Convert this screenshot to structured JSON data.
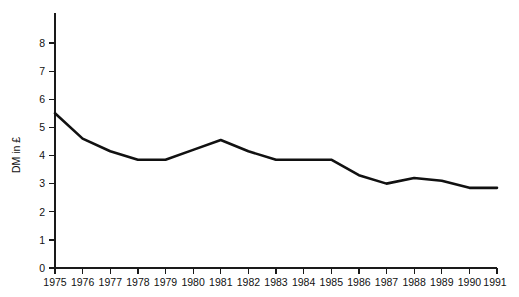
{
  "chart_data": {
    "type": "line",
    "title": "",
    "subtitle": "",
    "xlabel": "",
    "ylabel": "DM in £",
    "categories": [
      "1975",
      "1976",
      "1977",
      "1978",
      "1979",
      "1980",
      "1981",
      "1982",
      "1983",
      "1984",
      "1985",
      "1986",
      "1987",
      "1988",
      "1989",
      "1990",
      "1991"
    ],
    "x": [
      1975,
      1976,
      1977,
      1978,
      1979,
      1980,
      1981,
      1982,
      1983,
      1984,
      1985,
      1986,
      1987,
      1988,
      1989,
      1990,
      1991
    ],
    "values": [
      5.5,
      4.6,
      4.15,
      3.85,
      3.85,
      4.2,
      4.55,
      4.15,
      3.85,
      3.85,
      3.85,
      3.3,
      3.0,
      3.2,
      3.1,
      2.85,
      2.85
    ],
    "series": [
      {
        "name": "DM in £",
        "values": [
          5.5,
          4.6,
          4.15,
          3.85,
          3.85,
          4.2,
          4.55,
          4.15,
          3.85,
          3.85,
          3.85,
          3.3,
          3.0,
          3.2,
          3.1,
          2.85,
          2.85
        ],
        "color": "#111111"
      }
    ],
    "ylim": [
      0,
      8.6
    ],
    "xlim": [
      1975,
      1991
    ],
    "yticks": [
      0,
      1,
      2,
      3,
      4,
      5,
      6,
      7,
      8
    ],
    "ytick_labels": [
      "0",
      "1",
      "2",
      "3",
      "4",
      "5",
      "6",
      "7",
      "8"
    ],
    "xticks": [
      1975,
      1976,
      1977,
      1978,
      1979,
      1980,
      1981,
      1982,
      1983,
      1984,
      1985,
      1986,
      1987,
      1988,
      1989,
      1990,
      1991
    ],
    "xtick_labels": [
      "1975",
      "1976",
      "1977",
      "1978",
      "1979",
      "1980",
      "1981",
      "1982",
      "1983",
      "1984",
      "1985",
      "1986",
      "1987",
      "1988",
      "1989",
      "1990",
      "1991"
    ],
    "grid": false,
    "legend": false,
    "legend_position": "none",
    "annotations": [],
    "line_color": "#111111",
    "axis_color": "#1a1a1a",
    "background": "#ffffff"
  },
  "figure": {
    "ylabel": "DM in £"
  }
}
